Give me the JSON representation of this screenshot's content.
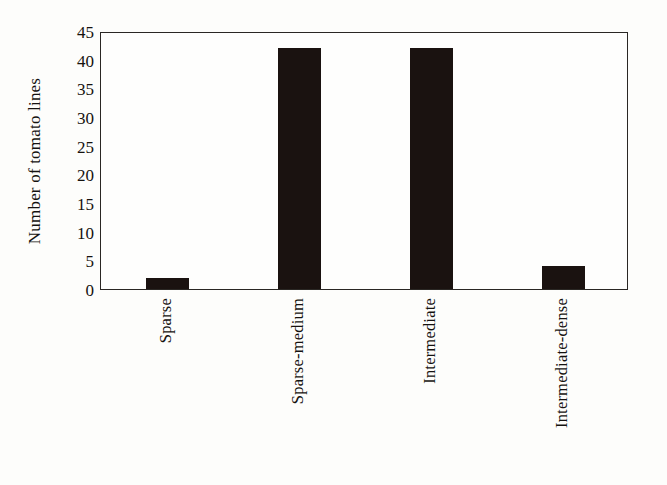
{
  "chart_data": {
    "type": "bar",
    "title": "",
    "xlabel": "",
    "ylabel": "Number of tomato lines",
    "categories": [
      "Sparse",
      "Sparse-medium",
      "Intermediate",
      "Intermediate-dense"
    ],
    "values": [
      2,
      42,
      42,
      4
    ],
    "ylim": [
      0,
      45
    ],
    "ytick_values": [
      0,
      5,
      10,
      15,
      20,
      25,
      30,
      35,
      40,
      45
    ],
    "ytick_labels": [
      "0",
      "5",
      "10",
      "15",
      "20",
      "25",
      "30",
      "35",
      "40",
      "45"
    ],
    "grid": false,
    "legend": false,
    "legend_position": "none",
    "bar_color": "#1a1210",
    "frame_color": "#2a2724",
    "background_color": "#fdfdfb",
    "orientation": "vertical",
    "xtick_label_rotation": 90
  }
}
